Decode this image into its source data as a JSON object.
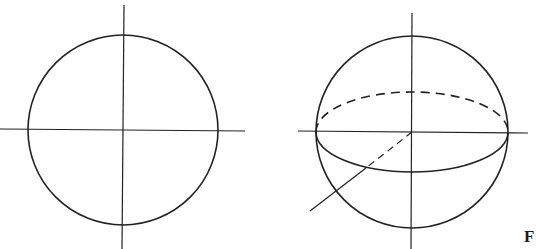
{
  "figure": {
    "stroke_color": "#222222",
    "background": "#ffffff",
    "left_diagram": {
      "description": "circle with horizontal and vertical axes",
      "circle": {
        "cx": 123,
        "cy": 130,
        "r": 95
      },
      "vertical_axis": {
        "x1": 124,
        "y1": 5,
        "x2": 122,
        "y2": 249
      },
      "horizontal_axis": {
        "x1": 0,
        "y1": 129,
        "x2": 245,
        "y2": 131
      }
    },
    "right_diagram": {
      "description": "sphere with equator ellipse (back half dashed) and three axes",
      "circle": {
        "cx": 412,
        "cy": 132,
        "r": 96
      },
      "equator": {
        "cx": 412,
        "cy": 132,
        "rx": 96,
        "ry": 40
      },
      "vertical_axis": {
        "x1": 412,
        "y1": 13,
        "x2": 411,
        "y2": 249
      },
      "horizontal_axis": {
        "x1": 298,
        "y1": 131,
        "x2": 528,
        "y2": 133
      },
      "oblique_axis": {
        "x1": 412,
        "y1": 132,
        "x2": 310,
        "y2": 211,
        "dashed_until": {
          "x": 366,
          "y": 168
        }
      }
    },
    "caption_fragment": "F"
  }
}
